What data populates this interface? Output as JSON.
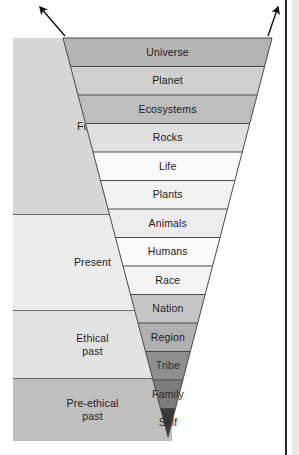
{
  "figure": {
    "background_color": "#ffffff"
  },
  "zones": [
    {
      "name": "zone-future",
      "label": "Future",
      "fill": "#d6d6d6",
      "top": 0,
      "height": 176
    },
    {
      "name": "zone-present",
      "label": "Present",
      "fill": "#ececec",
      "top": 176,
      "height": 96
    },
    {
      "name": "zone-ethical-past",
      "label": "Ethical\npast",
      "fill": "#e2e2e2",
      "top": 272,
      "height": 68
    },
    {
      "name": "zone-pre-ethical",
      "label": "Pre-ethical\npast",
      "fill": "#bfbfbf",
      "top": 340,
      "height": 63
    }
  ],
  "funnel": {
    "top_y": 38,
    "apex_y": 437,
    "top_left_x": 63,
    "top_right_x": 272,
    "apex_x": 168,
    "outline_color": "#4a4a4a",
    "bands": [
      {
        "name": "band-universe",
        "label": "Universe",
        "fill": "#b4b4b4",
        "text_on_dark": false
      },
      {
        "name": "band-planet",
        "label": "Planet",
        "fill": "#cfcfcf",
        "text_on_dark": false
      },
      {
        "name": "band-ecosystems",
        "label": "Ecosystems",
        "fill": "#bdbdbd",
        "text_on_dark": false
      },
      {
        "name": "band-rocks",
        "label": "Rocks",
        "fill": "#e0e0e0",
        "text_on_dark": false
      },
      {
        "name": "band-life",
        "label": "Life",
        "fill": "#fafafa",
        "text_on_dark": false
      },
      {
        "name": "band-plants",
        "label": "Plants",
        "fill": "#f2f2f2",
        "text_on_dark": false
      },
      {
        "name": "band-animals",
        "label": "Animals",
        "fill": "#ededed",
        "text_on_dark": false
      },
      {
        "name": "band-humans",
        "label": "Humans",
        "fill": "#fbfbfb",
        "text_on_dark": false
      },
      {
        "name": "band-race",
        "label": "Race",
        "fill": "#f4f4f4",
        "text_on_dark": false
      },
      {
        "name": "band-nation",
        "label": "Nation",
        "fill": "#c6c6c6",
        "text_on_dark": false
      },
      {
        "name": "band-region",
        "label": "Region",
        "fill": "#b0b0b0",
        "text_on_dark": false
      },
      {
        "name": "band-tribe",
        "label": "Tribe",
        "fill": "#8e8e8e",
        "text_on_dark": true
      },
      {
        "name": "band-family",
        "label": "Family",
        "fill": "#7c7c7c",
        "text_on_dark": true
      },
      {
        "name": "band-self",
        "label": "Self",
        "fill": "#3a3a3a",
        "text_on_dark": true
      }
    ]
  },
  "arrows": [
    {
      "name": "arrow-left-up",
      "x1": 65,
      "y1": 36,
      "x2": 40,
      "y2": 7
    },
    {
      "name": "arrow-right-up",
      "x1": 268,
      "y1": 36,
      "x2": 278,
      "y2": 7
    }
  ]
}
